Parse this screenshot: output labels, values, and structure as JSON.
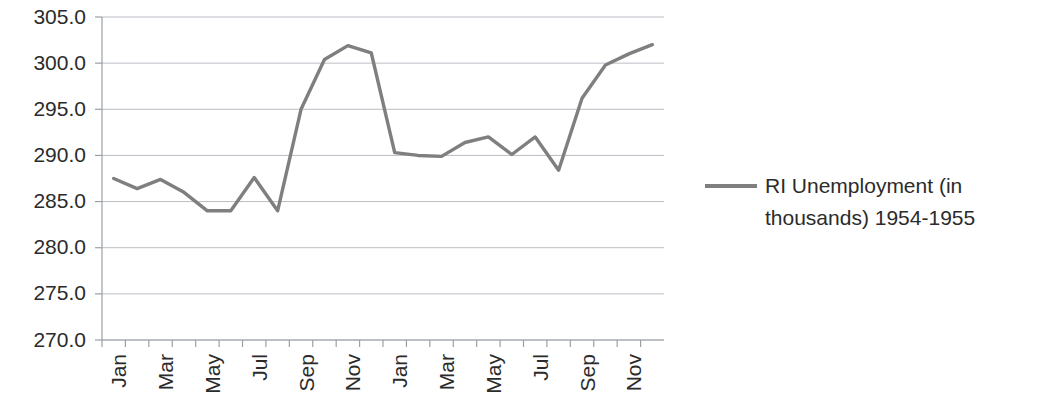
{
  "chart_data": {
    "type": "line",
    "title": "",
    "xlabel": "",
    "ylabel": "",
    "ylim": [
      270.0,
      305.0
    ],
    "ytick_step": 5.0,
    "ytick_labels": [
      "305.0",
      "300.0",
      "295.0",
      "290.0",
      "285.0",
      "280.0",
      "275.0",
      "270.0"
    ],
    "ytick_values": [
      305.0,
      300.0,
      295.0,
      290.0,
      285.0,
      280.0,
      275.0,
      270.0
    ],
    "grid": true,
    "legend_position": "right",
    "legend": [
      "RI Unemployment (in thousands) 1954-1955"
    ],
    "categories": [
      "Jan",
      "Feb",
      "Mar",
      "Apr",
      "May",
      "Jun",
      "Jul",
      "Aug",
      "Sep",
      "Oct",
      "Nov",
      "Dec",
      "Jan",
      "Feb",
      "Mar",
      "Apr",
      "May",
      "Jun",
      "Jul",
      "Aug",
      "Sep",
      "Oct",
      "Nov",
      "Dec"
    ],
    "xtick_labels_shown": [
      "Jan",
      "Mar",
      "May",
      "Jul",
      "Sep",
      "Nov",
      "Jan",
      "Mar",
      "May",
      "Jul",
      "Sep",
      "Nov"
    ],
    "series": [
      {
        "name": "RI Unemployment (in thousands) 1954-1955",
        "color": "#7f7f7f",
        "values": [
          287.5,
          286.4,
          287.4,
          286.0,
          284.0,
          284.0,
          287.6,
          284.0,
          295.0,
          300.4,
          301.9,
          301.1,
          290.3,
          290.0,
          289.9,
          291.4,
          292.0,
          290.1,
          292.0,
          288.4,
          296.2,
          299.8,
          301.0,
          302.0
        ]
      }
    ]
  },
  "legend": {
    "line1": "RI Unemployment (in",
    "line2": "thousands) 1954-1955"
  },
  "colors": {
    "series": "#7f7f7f",
    "grid": "#b9bec4",
    "axis": "#9aa0a6",
    "text": "#2b2b2b"
  }
}
